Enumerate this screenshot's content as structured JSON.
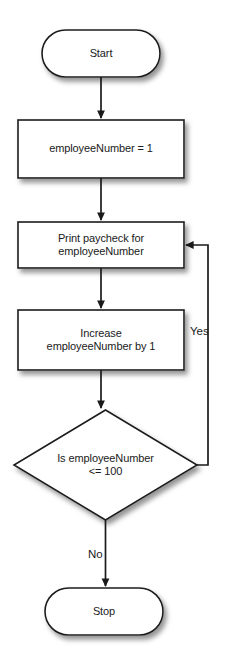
{
  "diagram": {
    "type": "flowchart",
    "colors": {
      "stroke": "#1a1a1a",
      "fill": "#ffffff",
      "text": "#1a1a1a",
      "shadow": "#9a9a9a",
      "background": "#ffffff"
    },
    "nodes": [
      {
        "id": "start",
        "shape": "terminator",
        "lines": [
          "Start"
        ],
        "x": 42,
        "y": 30,
        "width": 118,
        "height": 47
      },
      {
        "id": "init",
        "shape": "process",
        "lines": [
          "employeeNumber = 1"
        ],
        "x": 18,
        "y": 120,
        "width": 166,
        "height": 58
      },
      {
        "id": "print",
        "shape": "process",
        "lines": [
          "Print paycheck for",
          "employeeNumber"
        ],
        "x": 18,
        "y": 222,
        "width": 166,
        "height": 46
      },
      {
        "id": "increase",
        "shape": "process",
        "lines": [
          "Increase",
          "employeeNumber by 1"
        ],
        "x": 18,
        "y": 310,
        "width": 166,
        "height": 60
      },
      {
        "id": "decision",
        "shape": "decision",
        "lines": [
          "Is employeeNumber",
          "<= 100"
        ],
        "x": 14,
        "y": 410,
        "width": 183,
        "height": 110
      },
      {
        "id": "stop",
        "shape": "terminator",
        "lines": [
          "Stop"
        ],
        "x": 45,
        "y": 588,
        "width": 118,
        "height": 47
      }
    ],
    "edges": [
      {
        "id": "start-to-init",
        "from": "start",
        "to": "init",
        "label": ""
      },
      {
        "id": "init-to-print",
        "from": "init",
        "to": "print",
        "label": ""
      },
      {
        "id": "print-to-increase",
        "from": "print",
        "to": "increase",
        "label": ""
      },
      {
        "id": "increase-to-decision",
        "from": "increase",
        "to": "decision",
        "label": ""
      },
      {
        "id": "decision-yes-loop",
        "from": "decision",
        "to": "print",
        "label": "Yes",
        "label_x": 190,
        "label_y": 325
      },
      {
        "id": "decision-no-to-stop",
        "from": "decision",
        "to": "stop",
        "label": "No",
        "label_x": 88,
        "label_y": 548
      }
    ]
  }
}
